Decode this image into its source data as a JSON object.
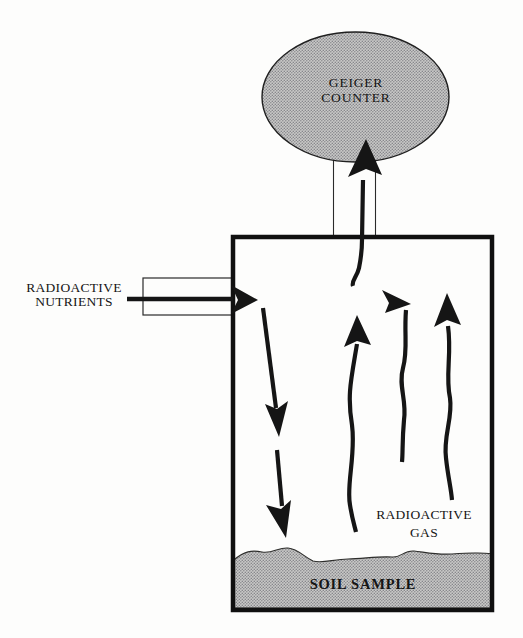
{
  "palette": {
    "paper": "#fdfdfc",
    "ink": "#151515",
    "halftone_base": "#c9c9c7",
    "halftone_dot": "#85858a"
  },
  "geiger_counter": {
    "label_line1": "GEIGER",
    "label_line2": "COUNTER"
  },
  "nutrients": {
    "label_line1": "RADIOACTIVE",
    "label_line2": "NUTRIENTS"
  },
  "gas": {
    "label_line1": "RADIOACTIVE",
    "label_line2": "GAS"
  },
  "soil": {
    "label": "SOIL SAMPLE"
  }
}
